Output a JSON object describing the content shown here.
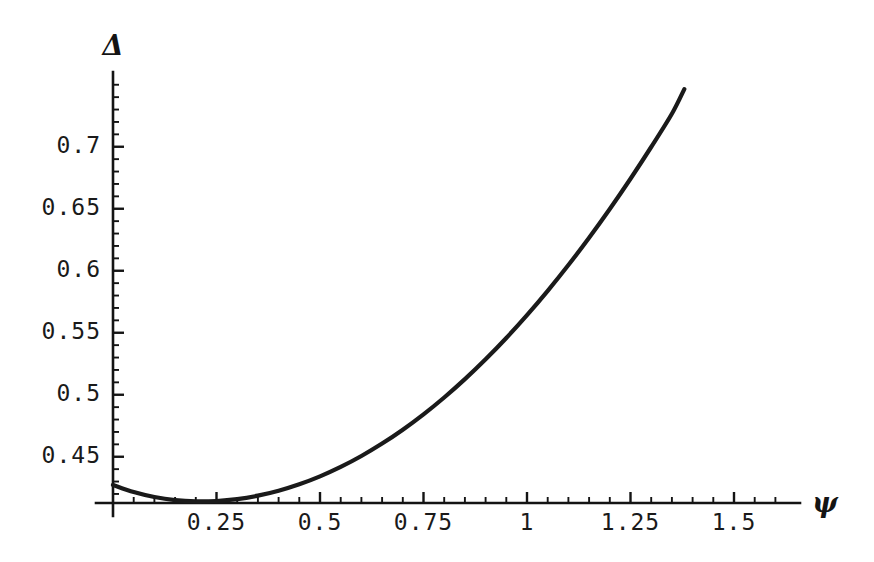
{
  "chart_data": {
    "type": "line",
    "title": "",
    "subtitle": "",
    "xlabel": "ψ",
    "ylabel": "Δ",
    "xlabel_name": "psi",
    "ylabel_name": "Delta",
    "grid": false,
    "legend": false,
    "legend_position": "none",
    "xlim": [
      0,
      1.62
    ],
    "ylim": [
      0.4127,
      0.7565
    ],
    "xticks": [
      0.25,
      0.5,
      0.75,
      1,
      1.25,
      1.5
    ],
    "xticklabels": [
      "0.25",
      "0.5",
      "0.75",
      "1",
      "1.25",
      "1.5"
    ],
    "yticks": [
      0.45,
      0.5,
      0.55,
      0.6,
      0.65,
      0.7
    ],
    "yticklabels": [
      "0.45",
      "0.5",
      "0.55",
      "0.6",
      "0.65",
      "0.7"
    ],
    "x_minor_step": 0.05,
    "y_minor_step": 0.01,
    "axis_baseline_value": 0.4127,
    "curve_color": "#1a1a1a",
    "series": [
      {
        "name": "Delta(psi)",
        "x": [
          0.0,
          0.05,
          0.1,
          0.15,
          0.2,
          0.25,
          0.3,
          0.35,
          0.4,
          0.45,
          0.5,
          0.55,
          0.6,
          0.65,
          0.7,
          0.75,
          0.8,
          0.85,
          0.9,
          0.95,
          1.0,
          1.05,
          1.1,
          1.15,
          1.2,
          1.25,
          1.3,
          1.35,
          1.38
        ],
        "y": [
          0.4273,
          0.4215,
          0.4175,
          0.415,
          0.414,
          0.4143,
          0.4158,
          0.4186,
          0.4226,
          0.4278,
          0.4342,
          0.4418,
          0.4506,
          0.4606,
          0.4718,
          0.4842,
          0.4978,
          0.5126,
          0.5286,
          0.5458,
          0.5642,
          0.5838,
          0.6046,
          0.6266,
          0.6498,
          0.6742,
          0.6998,
          0.7266,
          0.7465
        ]
      }
    ],
    "annotations": {
      "minimum_x": 0.21,
      "minimum_y": 0.4139,
      "start_y": 0.4273,
      "end_x": 1.38,
      "end_y": 0.7465
    }
  },
  "axes": {
    "y_axis_name": "y-axis",
    "x_axis_name": "x-axis"
  }
}
